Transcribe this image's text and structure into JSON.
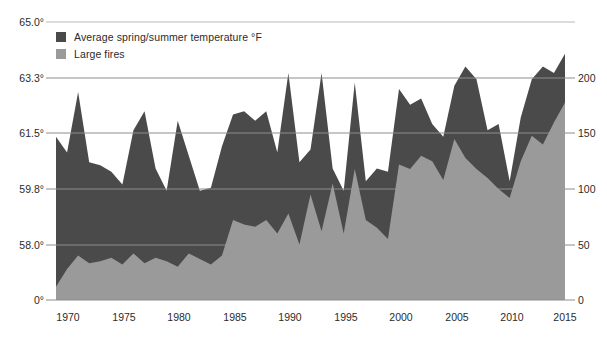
{
  "legend": {
    "position": "top-left",
    "items": [
      {
        "label": "Average spring/summer temperature °F",
        "color": "#4a4a4a",
        "swatch": "legend-swatch-temperature"
      },
      {
        "label": "Large fires",
        "color": "#9a9a9a",
        "swatch": "legend-swatch-fires"
      }
    ]
  },
  "colors": {
    "temperature_area": "#4a4a4a",
    "fires_area": "#9a9a9a",
    "gridline": "#8d8d8d",
    "top_gridline": "#b9b9b9",
    "text": "#2b2b2b",
    "background": "#ffffff"
  },
  "chart_data": {
    "type": "area",
    "title": "",
    "subtitle": "",
    "xlabel": "",
    "ylabel": "",
    "grid": true,
    "legend_position": "top-left",
    "x": [
      1969,
      1970,
      1971,
      1972,
      1973,
      1974,
      1975,
      1976,
      1977,
      1978,
      1979,
      1980,
      1981,
      1982,
      1983,
      1984,
      1985,
      1986,
      1987,
      1988,
      1989,
      1990,
      1991,
      1992,
      1993,
      1994,
      1995,
      1996,
      1997,
      1998,
      1999,
      2000,
      2001,
      2002,
      2003,
      2004,
      2005,
      2006,
      2007,
      2008,
      2009,
      2010,
      2011,
      2012,
      2013,
      2014,
      2015
    ],
    "xlim": [
      1969,
      2015
    ],
    "xticks": [
      1970,
      1975,
      1980,
      1985,
      1990,
      1995,
      2000,
      2005,
      2010,
      2015
    ],
    "xticklabels": [
      "1970",
      "1975",
      "1980",
      "1985",
      "1990",
      "1995",
      "2000",
      "2005",
      "2010",
      "2015"
    ],
    "left_axis": {
      "name": "Average spring/summer temperature °F",
      "ticks": [
        0,
        58.0,
        59.8,
        61.5,
        63.3,
        65.0
      ],
      "ticklabels": [
        "0°",
        "58.0°",
        "59.8°",
        "61.5°",
        "63.3°",
        "65.0°"
      ],
      "lim": [
        56.2,
        65.0
      ]
    },
    "right_axis": {
      "name": "Large fires",
      "ticks": [
        0,
        50,
        100,
        150,
        200
      ],
      "ticklabels": [
        "0",
        "50",
        "100",
        "150",
        "200"
      ],
      "lim": [
        0,
        225
      ]
    },
    "series": [
      {
        "name": "Average spring/summer temperature °F",
        "axis": "left",
        "color": "#4a4a4a",
        "values": [
          61.4,
          60.9,
          62.8,
          60.6,
          60.5,
          60.3,
          59.9,
          61.6,
          62.2,
          60.4,
          59.7,
          61.9,
          60.8,
          59.7,
          59.8,
          61.1,
          62.1,
          62.2,
          61.9,
          62.2,
          60.9,
          63.4,
          60.6,
          61.0,
          63.4,
          60.4,
          59.7,
          63.1,
          60.0,
          60.4,
          60.3,
          62.9,
          62.4,
          62.6,
          61.8,
          61.4,
          63.0,
          63.6,
          63.2,
          61.6,
          61.8,
          60.0,
          62.0,
          63.2,
          63.6,
          63.4,
          64.0
        ]
      },
      {
        "name": "Large fires",
        "axis": "right",
        "color": "#9a9a9a",
        "values": [
          12,
          28,
          40,
          33,
          35,
          38,
          32,
          42,
          33,
          38,
          35,
          30,
          42,
          37,
          32,
          40,
          72,
          68,
          66,
          72,
          60,
          78,
          50,
          95,
          62,
          105,
          60,
          118,
          72,
          65,
          55,
          122,
          118,
          130,
          125,
          108,
          145,
          128,
          118,
          110,
          100,
          92,
          125,
          148,
          140,
          160,
          178
        ]
      }
    ]
  },
  "axes": {
    "left_labels": [
      "65.0°",
      "63.3°",
      "61.5°",
      "59.8°",
      "58.0°",
      "0°"
    ],
    "right_labels": [
      "200",
      "150",
      "100",
      "50",
      "0"
    ],
    "x_labels": [
      "1970",
      "1975",
      "1980",
      "1985",
      "1990",
      "1995",
      "2000",
      "2005",
      "2010",
      "2015"
    ]
  }
}
